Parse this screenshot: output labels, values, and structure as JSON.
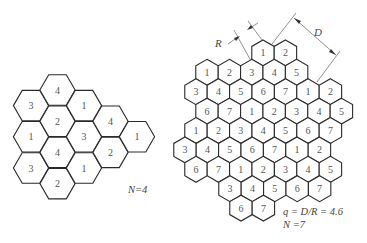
{
  "left_cluster": {
    "caption": "N=4",
    "hex_radius": 17.6,
    "orientation": "flat-top",
    "columns": [
      {
        "x": 31,
        "cells": [
          {
            "y": 105.6,
            "label": "3"
          },
          {
            "y": 136.8,
            "label": "1"
          },
          {
            "y": 168,
            "label": "3"
          }
        ]
      },
      {
        "x": 57.5,
        "cells": [
          {
            "y": 90,
            "label": "4"
          },
          {
            "y": 121.2,
            "label": "2"
          },
          {
            "y": 152.4,
            "label": "4"
          },
          {
            "y": 183.6,
            "label": "2"
          }
        ]
      },
      {
        "x": 84,
        "cells": [
          {
            "y": 105.6,
            "label": "1"
          },
          {
            "y": 136.8,
            "label": "3"
          },
          {
            "y": 168,
            "label": "1"
          }
        ]
      },
      {
        "x": 110.5,
        "cells": [
          {
            "y": 121.2,
            "label": "4"
          },
          {
            "y": 152.4,
            "label": "2"
          }
        ]
      },
      {
        "x": 137,
        "cells": [
          {
            "y": 136.8,
            "label": "1"
          }
        ]
      }
    ]
  },
  "right_cluster": {
    "caption_q": "q = D/R = 4.6",
    "caption_n": "N =7",
    "hex_radius": 12.95,
    "orientation": "pointy-top",
    "dx": 22.4,
    "rows": [
      {
        "y": 52.9,
        "x0": 263,
        "labels": [
          "1",
          "2"
        ]
      },
      {
        "y": 72.3,
        "x0": 207,
        "labels": [
          "1",
          "2",
          "3",
          "4",
          "5"
        ]
      },
      {
        "y": 91.7,
        "x0": 196,
        "labels": [
          "3",
          "4",
          "5",
          "6",
          "7",
          "1",
          "2"
        ]
      },
      {
        "y": 111.1,
        "x0": 207,
        "labels": [
          "6",
          "7",
          "1",
          "2",
          "3",
          "4",
          "5"
        ]
      },
      {
        "y": 130.5,
        "x0": 196,
        "labels": [
          "1",
          "2",
          "3",
          "4",
          "5",
          "6",
          "7"
        ]
      },
      {
        "y": 149.9,
        "x0": 185,
        "labels": [
          "3",
          "4",
          "5",
          "6",
          "7",
          "1",
          "2"
        ]
      },
      {
        "y": 169.3,
        "x0": 196,
        "labels": [
          "6",
          "7",
          "1",
          "2",
          "3",
          "4",
          "5"
        ]
      },
      {
        "y": 188.7,
        "x0": 230,
        "labels": [
          "3",
          "4",
          "5",
          "6",
          "7"
        ]
      },
      {
        "y": 208.1,
        "x0": 241,
        "labels": [
          "6",
          "7"
        ]
      }
    ],
    "dimensions": {
      "R_label": "R",
      "D_label": "D"
    }
  }
}
